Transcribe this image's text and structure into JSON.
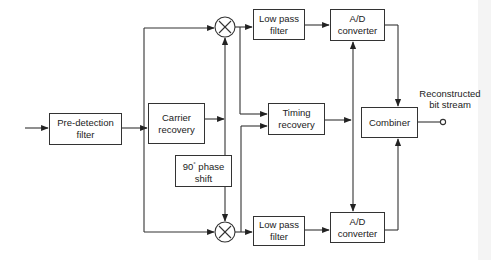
{
  "diagram": {
    "type": "block-diagram",
    "blocks": {
      "pre_detection_filter": {
        "line1": "Pre-detection",
        "line2": "filter"
      },
      "carrier_recovery": {
        "line1": "Carrier",
        "line2": "recovery"
      },
      "phase_shift": {
        "line1_num": "90",
        "line1_sup": "°",
        "line1_rest": " phase",
        "line2": "shift"
      },
      "lpf_top": {
        "line1": "Low pass",
        "line2": "filter"
      },
      "lpf_bottom": {
        "line1": "Low pass",
        "line2": "filter"
      },
      "timing_recovery": {
        "line1": "Timing",
        "line2": "recovery"
      },
      "ad_top": {
        "line1": "A/D",
        "line2": "converter"
      },
      "ad_bottom": {
        "line1": "A/D",
        "line2": "converter"
      },
      "combiner": {
        "line1": "Combiner"
      }
    },
    "mixers": [
      {
        "id": "mixer-top",
        "symbol": "×"
      },
      {
        "id": "mixer-bottom",
        "symbol": "×"
      }
    ],
    "output_label": {
      "line1": "Reconstructed",
      "line2": "bit stream"
    },
    "edges": [
      [
        "input",
        "pre_detection_filter"
      ],
      [
        "pre_detection_filter",
        "carrier_recovery"
      ],
      [
        "pre_detection_filter",
        "mixer-top"
      ],
      [
        "pre_detection_filter",
        "mixer-bottom"
      ],
      [
        "carrier_recovery",
        "mixer-top"
      ],
      [
        "carrier_recovery",
        "phase_shift"
      ],
      [
        "phase_shift",
        "mixer-bottom"
      ],
      [
        "mixer-top",
        "lpf_top"
      ],
      [
        "mixer-top",
        "timing_recovery"
      ],
      [
        "mixer-bottom",
        "lpf_bottom"
      ],
      [
        "mixer-bottom",
        "timing_recovery"
      ],
      [
        "lpf_top",
        "ad_top"
      ],
      [
        "lpf_bottom",
        "ad_bottom"
      ],
      [
        "timing_recovery",
        "ad_top"
      ],
      [
        "timing_recovery",
        "ad_bottom"
      ],
      [
        "ad_top",
        "combiner"
      ],
      [
        "ad_bottom",
        "combiner"
      ],
      [
        "combiner",
        "output"
      ]
    ]
  }
}
